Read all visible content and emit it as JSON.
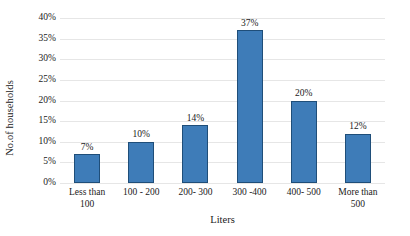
{
  "chart_data": {
    "type": "bar",
    "title": "",
    "xlabel": "Liters",
    "ylabel": "No.of households",
    "categories": [
      "Less than 100",
      "100 - 200",
      "200- 300",
      "300 -400",
      "400- 500",
      "More than 500"
    ],
    "values": [
      7,
      10,
      14,
      37,
      20,
      12
    ],
    "data_labels": [
      "7%",
      "10%",
      "14%",
      "37%",
      "20%",
      "12%"
    ],
    "ylim": [
      0,
      40
    ],
    "ytick_values": [
      0,
      5,
      10,
      15,
      20,
      25,
      30,
      35,
      40
    ],
    "ytick_labels": [
      "0%",
      "5%",
      "10%",
      "15%",
      "20%",
      "25%",
      "30%",
      "35%",
      "40%"
    ],
    "grid": "horizontal",
    "legend": "none",
    "bar_fill_color": "#3e7cb8",
    "bar_border_color": "#1f4e79",
    "gridline_color": "#e6e6e6",
    "background_color": "#ffffff"
  }
}
